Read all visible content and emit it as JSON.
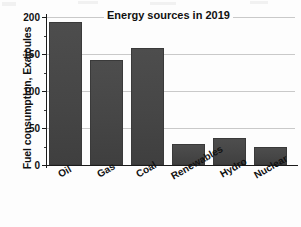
{
  "chart_data": {
    "type": "bar",
    "title": "Energy sources in 2019",
    "xlabel": "",
    "ylabel": "Fuel consumption, Exajoules",
    "categories": [
      "Oil",
      "Gas",
      "Coal",
      "Renewables",
      "Hydro",
      "Nuclear"
    ],
    "values": [
      193,
      142,
      158,
      28,
      37,
      24
    ],
    "ylim": [
      0,
      200
    ],
    "yticks": [
      0,
      50,
      100,
      150,
      200
    ],
    "ytick_labels": [
      "0",
      "50",
      "100",
      "150",
      "200"
    ],
    "grid": true,
    "legend": "none",
    "bar_color": "#474747",
    "axis_color": "#1b1b1b",
    "grid_color": "#c9c9c9",
    "background": "#fdfdfd"
  }
}
